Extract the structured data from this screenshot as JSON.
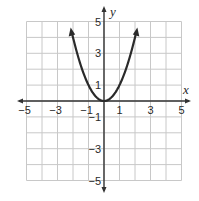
{
  "chart_data": {
    "type": "line",
    "title": "",
    "xlabel": "x",
    "ylabel": "y",
    "xlim": [
      -5,
      5
    ],
    "ylim": [
      -5,
      5
    ],
    "grid": true,
    "x_ticks": [
      -5,
      -3,
      -1,
      1,
      3,
      5
    ],
    "y_ticks": [
      5,
      3,
      1,
      -1,
      -3,
      -5
    ],
    "x_tick_labels": [
      "−5",
      "−3",
      "−1",
      "1",
      "3",
      "5"
    ],
    "y_tick_labels": [
      "5",
      "3",
      "1",
      "−1",
      "−3",
      "−5"
    ],
    "series": [
      {
        "name": "y = x^2",
        "function": "x^2",
        "x": [
          -2.15,
          -2,
          -1.5,
          -1,
          -0.5,
          0,
          0.5,
          1,
          1.5,
          2,
          2.15
        ],
        "y": [
          4.62,
          4,
          2.25,
          1,
          0.25,
          0,
          0.25,
          1,
          2.25,
          4,
          4.62
        ],
        "arrows_at_ends": true,
        "color": "#2a2a2a"
      }
    ]
  },
  "colors": {
    "grid": "#c8c8c8",
    "axis": "#333333",
    "curve": "#2a2a2a"
  }
}
